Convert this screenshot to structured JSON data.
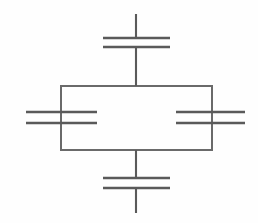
{
  "document": {
    "title": "Capacitor Bridge Circuit Diagram",
    "type": "electrical-schematic",
    "background_color": "#fefefe",
    "ink_color": "#5a5a5a",
    "width": 258,
    "height": 223
  },
  "diagram": {
    "components": [
      {
        "id": "capacitor-top",
        "label": "",
        "symbol": "capacitor",
        "orientation": "horizontal-plates",
        "plate_y": [
          38,
          47
        ],
        "plate_x_start": 103,
        "plate_x_end": 170,
        "lead_x": 136,
        "lead_top_y": 14,
        "lead_bottom_y": 86
      },
      {
        "id": "capacitor-bottom",
        "label": "",
        "symbol": "capacitor",
        "orientation": "horizontal-plates",
        "plate_y": [
          178,
          188
        ],
        "plate_x_start": 103,
        "plate_x_end": 170,
        "lead_x": 136,
        "lead_top_y": 150,
        "lead_bottom_y": 213
      },
      {
        "id": "capacitor-left",
        "label": "",
        "symbol": "capacitor",
        "orientation": "horizontal-plates",
        "plate_y": [
          112,
          123
        ],
        "plate_x_start": 26,
        "plate_x_end": 97,
        "lead_x": 61,
        "lead_top_y": 86,
        "lead_bottom_y": 150
      },
      {
        "id": "capacitor-right",
        "label": "",
        "symbol": "capacitor",
        "orientation": "horizontal-plates",
        "plate_y": [
          112,
          123
        ],
        "plate_x_start": 176,
        "plate_x_end": 245,
        "lead_x": 212,
        "lead_top_y": 86,
        "lead_bottom_y": 150
      }
    ],
    "loop": {
      "id": "central-rectangle",
      "x": 61,
      "y": 86,
      "width": 151,
      "height": 64
    },
    "terminals": [
      {
        "id": "terminal-top",
        "x": 136,
        "y": 14
      },
      {
        "id": "terminal-bottom",
        "x": 136,
        "y": 213
      },
      {
        "id": "terminal-left",
        "x": 26,
        "y": 117
      },
      {
        "id": "terminal-right",
        "x": 245,
        "y": 117
      }
    ]
  }
}
